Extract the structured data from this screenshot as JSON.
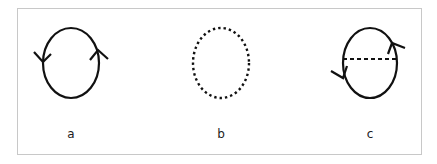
{
  "diagrams": [
    {
      "id": "a",
      "label": "a",
      "style": "solid loop with two arrows",
      "cx": 71,
      "cy": 63,
      "rx": 28,
      "ry": 35,
      "arrows": [
        {
          "side": "left",
          "direction": "down"
        },
        {
          "side": "right",
          "direction": "up"
        }
      ]
    },
    {
      "id": "b",
      "label": "b",
      "style": "dotted loop",
      "cx": 221,
      "cy": 63,
      "rx": 28,
      "ry": 35
    },
    {
      "id": "c",
      "label": "c",
      "style": "solid loop with two arrows and dashed horizontal chord",
      "cx": 370,
      "cy": 63,
      "rx": 27,
      "ry": 35,
      "chord_y": 59,
      "arrows": [
        {
          "side": "left",
          "direction": "down"
        },
        {
          "side": "right",
          "direction": "up"
        }
      ]
    }
  ],
  "colors": {
    "stroke": "#111111",
    "frame": "#c8c8c8",
    "background": "#ffffff"
  }
}
